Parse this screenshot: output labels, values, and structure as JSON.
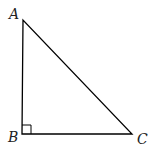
{
  "diagram": {
    "type": "right-triangle",
    "vertices": [
      {
        "label": "A",
        "x": 23,
        "y": 20
      },
      {
        "label": "B",
        "x": 22,
        "y": 134
      },
      {
        "label": "C",
        "x": 132,
        "y": 134
      }
    ],
    "right_angle_at": "B",
    "stroke_color": "#000000"
  }
}
